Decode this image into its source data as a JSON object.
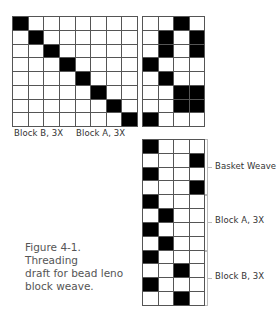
{
  "figure": {
    "caption": "Figure 4-1. Threading draft for bead leno block weave.",
    "caption_lines": [
      "Figure 4-1. Threading",
      "draft for bead leno",
      "block weave."
    ]
  },
  "treadling_grid": {
    "cols": 8,
    "rows": 8,
    "labels": [
      "Block B, 3X",
      "Block A, 3X"
    ],
    "cells": [
      [
        1,
        0,
        0,
        0,
        0,
        0,
        0,
        0
      ],
      [
        0,
        1,
        0,
        0,
        0,
        0,
        0,
        0
      ],
      [
        0,
        0,
        1,
        0,
        0,
        0,
        0,
        0
      ],
      [
        0,
        0,
        0,
        1,
        0,
        0,
        0,
        0
      ],
      [
        0,
        0,
        0,
        0,
        1,
        0,
        0,
        0
      ],
      [
        0,
        0,
        0,
        0,
        0,
        1,
        0,
        0
      ],
      [
        0,
        0,
        0,
        0,
        0,
        0,
        1,
        0
      ],
      [
        0,
        0,
        0,
        0,
        0,
        0,
        0,
        1
      ]
    ]
  },
  "tieup_grid": {
    "cols": 4,
    "rows": 8,
    "cells": [
      [
        0,
        0,
        1,
        0
      ],
      [
        0,
        1,
        0,
        1
      ],
      [
        0,
        1,
        0,
        1
      ],
      [
        1,
        0,
        0,
        0
      ],
      [
        0,
        1,
        0,
        0
      ],
      [
        0,
        0,
        1,
        1
      ],
      [
        0,
        0,
        1,
        1
      ],
      [
        1,
        0,
        0,
        0
      ]
    ]
  },
  "threading_grid": {
    "cols": 4,
    "rows": 12,
    "cells": [
      [
        1,
        0,
        0,
        0
      ],
      [
        0,
        0,
        0,
        1
      ],
      [
        1,
        0,
        0,
        0
      ],
      [
        0,
        0,
        0,
        1
      ],
      [
        1,
        0,
        0,
        0
      ],
      [
        0,
        1,
        0,
        0
      ],
      [
        1,
        0,
        0,
        0
      ],
      [
        0,
        1,
        0,
        0
      ],
      [
        1,
        0,
        0,
        0
      ],
      [
        0,
        0,
        1,
        0
      ],
      [
        1,
        0,
        0,
        0
      ],
      [
        0,
        0,
        1,
        0
      ]
    ],
    "sections": [
      {
        "label": "Basket Weave",
        "start_row": 0,
        "end_row": 3
      },
      {
        "label": "Block A, 3X",
        "start_row": 4,
        "end_row": 7
      },
      {
        "label": "Block B, 3X",
        "start_row": 8,
        "end_row": 11
      }
    ]
  },
  "colors": {
    "filled": "#000000",
    "empty": "#ffffff",
    "gridline": "#555555",
    "caption": "#555555"
  }
}
